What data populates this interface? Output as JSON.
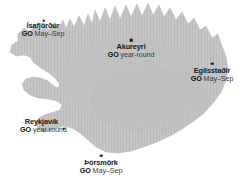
{
  "map": {
    "title": "Iceland destinations map",
    "land_color": "#c3c3c3",
    "land_hatch_color": "#b4b4b4",
    "background_color": "#ffffff",
    "marker_color": "#111111",
    "label_color": "#1a1a1a"
  },
  "cities": [
    {
      "id": "isafjordur",
      "name": "Ísafjörður",
      "go_word": "GO",
      "go_season": "May–Sep",
      "label_x": 43,
      "label_y": 22,
      "marker_x": 43.5,
      "marker_y": 20.5,
      "align": "center"
    },
    {
      "id": "akureyri",
      "name": "Akureyri",
      "go_word": "GO",
      "go_season": "year-round",
      "label_x": 131,
      "label_y": 43,
      "marker_x": 131,
      "marker_y": 40,
      "align": "center"
    },
    {
      "id": "egilsstadir",
      "name": "Egilsstaðir",
      "go_word": "GO",
      "go_season": "May–Sep",
      "label_x": 212,
      "label_y": 67,
      "marker_x": 212,
      "marker_y": 63.5,
      "align": "center"
    },
    {
      "id": "reykjavik",
      "name": "Reykjavík",
      "go_word": "GO",
      "go_season": "year-round",
      "label_x": 20,
      "label_y": 118,
      "marker_x": 63.5,
      "marker_y": 128.5,
      "align": "right"
    },
    {
      "id": "thorsmork",
      "name": "Þórsmörk",
      "go_word": "GO",
      "go_season": "May–Sep",
      "label_x": 101,
      "label_y": 159,
      "marker_x": 101,
      "marker_y": 155.5,
      "align": "center"
    }
  ]
}
